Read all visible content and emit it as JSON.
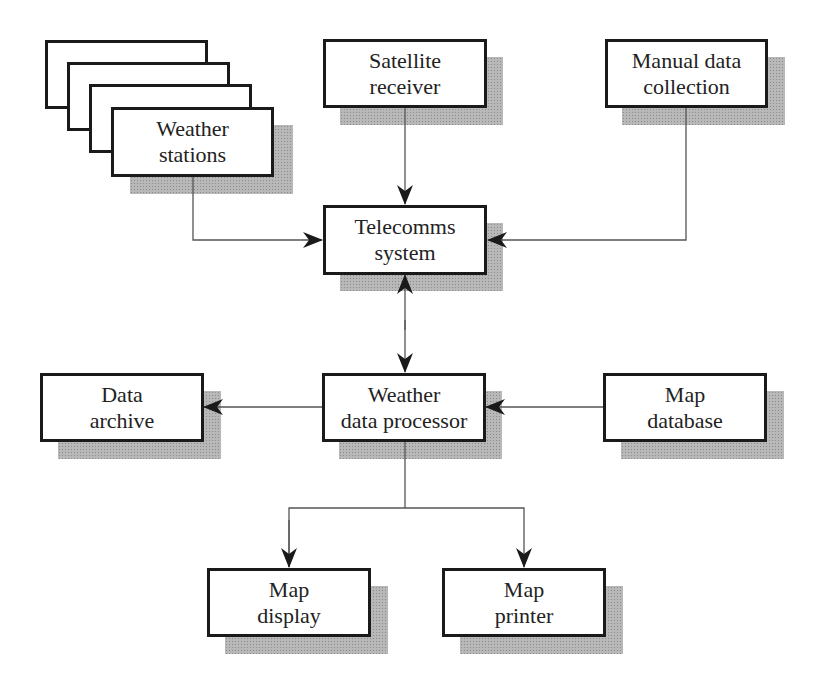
{
  "diagram": {
    "type": "flowchart",
    "nodes": {
      "weather_stations": {
        "line1": "Weather",
        "line2": "stations",
        "stacked_copies": 4
      },
      "satellite_receiver": {
        "line1": "Satellite",
        "line2": "receiver"
      },
      "manual_data_collection": {
        "line1": "Manual data",
        "line2": "collection"
      },
      "telecomms_system": {
        "line1": "Telecomms",
        "line2": "system"
      },
      "data_archive": {
        "line1": "Data",
        "line2": "archive"
      },
      "weather_data_processor": {
        "line1": "Weather",
        "line2": "data processor"
      },
      "map_database": {
        "line1": "Map",
        "line2": "database"
      },
      "map_display": {
        "line1": "Map",
        "line2": "display"
      },
      "map_printer": {
        "line1": "Map",
        "line2": "printer"
      }
    },
    "edges": [
      {
        "from": "Weather stations",
        "to": "Telecomms system",
        "direction": "one-way"
      },
      {
        "from": "Satellite receiver",
        "to": "Telecomms system",
        "direction": "one-way"
      },
      {
        "from": "Manual data collection",
        "to": "Telecomms system",
        "direction": "one-way"
      },
      {
        "from": "Telecomms system",
        "to": "Weather data processor",
        "direction": "two-way"
      },
      {
        "from": "Weather data processor",
        "to": "Data archive",
        "direction": "one-way"
      },
      {
        "from": "Map database",
        "to": "Weather data processor",
        "direction": "one-way"
      },
      {
        "from": "Weather data processor",
        "to": "Map display",
        "direction": "one-way"
      },
      {
        "from": "Weather data processor",
        "to": "Map printer",
        "direction": "one-way"
      }
    ],
    "colors": {
      "border": "#1a1a1a",
      "line": "#555555",
      "shadow": "#b8b8b8",
      "background": "#ffffff"
    }
  }
}
